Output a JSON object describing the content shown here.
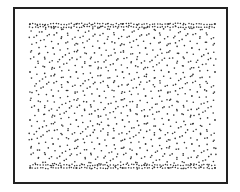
{
  "figure": {
    "border_color": "#222222",
    "dot_color": "#333333",
    "background_color": "#ffffff",
    "pattern": {
      "grid_columns": 4,
      "grid_rows": 3,
      "rings_per_cell": 3,
      "dense_edge_rows": true
    }
  }
}
